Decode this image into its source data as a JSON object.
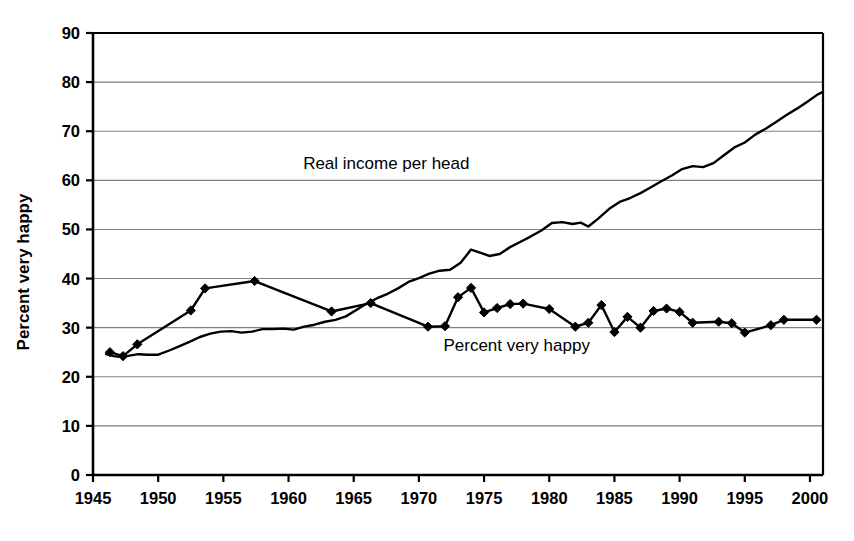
{
  "chart_data": {
    "type": "line",
    "title": "",
    "subtitle": "",
    "xlabel": "",
    "ylabel": "Percent very happy",
    "xlim": [
      1945,
      2001
    ],
    "ylim": [
      0,
      90
    ],
    "grid": true,
    "grid_axis": "y",
    "legend_position": "inline-annotations",
    "x_ticks": [
      1945,
      1950,
      1955,
      1960,
      1965,
      1970,
      1975,
      1980,
      1985,
      1990,
      1995,
      2000
    ],
    "x_tick_labels": [
      "1945",
      "1950",
      "1955",
      "1960",
      "1965",
      "1970",
      "1975",
      "1980",
      "1985",
      "1990",
      "1995",
      "2000"
    ],
    "y_ticks": [
      0,
      10,
      20,
      30,
      40,
      50,
      60,
      70,
      80,
      90
    ],
    "y_tick_labels": [
      "0",
      "10",
      "20",
      "30",
      "40",
      "50",
      "60",
      "70",
      "80",
      "90"
    ],
    "annotations": [
      {
        "name": "real-income-label",
        "text": "Real income per head",
        "x": 1967.5,
        "y": 63.5
      },
      {
        "name": "percent-very-happy-label",
        "text": "Percent very happy",
        "y": 26.5,
        "x": 1977.5
      }
    ],
    "series": [
      {
        "name": "Real income per head",
        "marker": "none",
        "color": "#000000",
        "points": [
          [
            1946.0,
            24.6
          ],
          [
            1946.6,
            24.2
          ],
          [
            1947.2,
            24.0
          ],
          [
            1947.8,
            24.3
          ],
          [
            1948.5,
            24.6
          ],
          [
            1949.2,
            24.5
          ],
          [
            1950.0,
            24.5
          ],
          [
            1950.8,
            25.3
          ],
          [
            1951.6,
            26.2
          ],
          [
            1952.4,
            27.1
          ],
          [
            1953.2,
            28.1
          ],
          [
            1954.0,
            28.8
          ],
          [
            1954.8,
            29.2
          ],
          [
            1955.6,
            29.3
          ],
          [
            1956.4,
            29.0
          ],
          [
            1957.2,
            29.2
          ],
          [
            1958.0,
            29.7
          ],
          [
            1958.8,
            29.7
          ],
          [
            1959.6,
            29.8
          ],
          [
            1960.4,
            29.6
          ],
          [
            1961.2,
            30.2
          ],
          [
            1962.0,
            30.6
          ],
          [
            1962.8,
            31.2
          ],
          [
            1963.6,
            31.6
          ],
          [
            1964.4,
            32.3
          ],
          [
            1965.2,
            33.6
          ],
          [
            1966.0,
            34.9
          ],
          [
            1966.8,
            36.0
          ],
          [
            1967.6,
            36.9
          ],
          [
            1968.4,
            38.0
          ],
          [
            1969.2,
            39.3
          ],
          [
            1970.0,
            40.1
          ],
          [
            1970.8,
            41.0
          ],
          [
            1971.6,
            41.6
          ],
          [
            1972.4,
            41.8
          ],
          [
            1973.2,
            43.2
          ],
          [
            1974.0,
            45.9
          ],
          [
            1974.8,
            45.2
          ],
          [
            1975.4,
            44.6
          ],
          [
            1976.2,
            45.0
          ],
          [
            1977.0,
            46.4
          ],
          [
            1977.8,
            47.5
          ],
          [
            1978.6,
            48.6
          ],
          [
            1979.4,
            49.8
          ],
          [
            1980.2,
            51.3
          ],
          [
            1981.0,
            51.5
          ],
          [
            1981.8,
            51.1
          ],
          [
            1982.4,
            51.4
          ],
          [
            1983.0,
            50.6
          ],
          [
            1983.8,
            52.3
          ],
          [
            1984.6,
            54.2
          ],
          [
            1985.4,
            55.6
          ],
          [
            1986.2,
            56.4
          ],
          [
            1987.0,
            57.4
          ],
          [
            1987.8,
            58.6
          ],
          [
            1988.6,
            59.8
          ],
          [
            1989.4,
            61.0
          ],
          [
            1990.2,
            62.3
          ],
          [
            1991.0,
            62.9
          ],
          [
            1991.8,
            62.7
          ],
          [
            1992.6,
            63.5
          ],
          [
            1993.4,
            65.1
          ],
          [
            1994.2,
            66.7
          ],
          [
            1995.0,
            67.7
          ],
          [
            1995.8,
            69.3
          ],
          [
            1996.6,
            70.5
          ],
          [
            1997.4,
            71.9
          ],
          [
            1998.2,
            73.3
          ],
          [
            1999.0,
            74.6
          ],
          [
            1999.8,
            76.0
          ],
          [
            2000.6,
            77.5
          ],
          [
            2001.0,
            78.0
          ]
        ]
      },
      {
        "name": "Percent very happy",
        "marker": "diamond",
        "color": "#000000",
        "points": [
          [
            1946.3,
            25.0
          ],
          [
            1947.3,
            24.2
          ],
          [
            1948.4,
            26.6
          ],
          [
            1952.5,
            33.5
          ],
          [
            1953.6,
            38.0
          ],
          [
            1957.4,
            39.5
          ],
          [
            1963.3,
            33.3
          ],
          [
            1966.3,
            35.0
          ],
          [
            1970.7,
            30.2
          ],
          [
            1972.0,
            30.3
          ],
          [
            1973.0,
            36.2
          ],
          [
            1974.0,
            38.1
          ],
          [
            1975.0,
            33.1
          ],
          [
            1976.0,
            34.0
          ],
          [
            1977.0,
            34.8
          ],
          [
            1978.0,
            34.9
          ],
          [
            1980.0,
            33.8
          ],
          [
            1982.0,
            30.2
          ],
          [
            1983.0,
            31.0
          ],
          [
            1984.0,
            34.6
          ],
          [
            1985.0,
            29.1
          ],
          [
            1986.0,
            32.2
          ],
          [
            1987.0,
            30.0
          ],
          [
            1988.0,
            33.4
          ],
          [
            1989.0,
            33.9
          ],
          [
            1990.0,
            33.2
          ],
          [
            1991.0,
            31.0
          ],
          [
            1993.0,
            31.2
          ],
          [
            1994.0,
            30.9
          ],
          [
            1995.0,
            29.0
          ],
          [
            1997.0,
            30.5
          ],
          [
            1998.0,
            31.6
          ],
          [
            2000.5,
            31.6
          ]
        ]
      }
    ]
  }
}
